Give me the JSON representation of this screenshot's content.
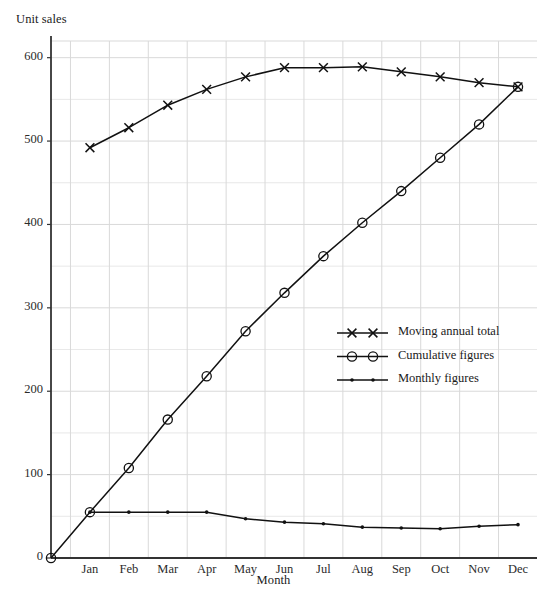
{
  "chart_data": {
    "type": "line",
    "title": "",
    "xlabel": "Month",
    "ylabel": "Unit sales",
    "categories": [
      "Jan",
      "Feb",
      "Mar",
      "Apr",
      "May",
      "Jun",
      "Jul",
      "Aug",
      "Sep",
      "Oct",
      "Nov",
      "Dec"
    ],
    "ylim": [
      0,
      620
    ],
    "yticks": [
      0,
      100,
      200,
      300,
      400,
      500,
      600
    ],
    "ytick_labels": [
      "0",
      "100",
      "200",
      "300",
      "400",
      "500",
      "600"
    ],
    "minor_y_step": 50,
    "grid": true,
    "grid_color": "#d9d9d9",
    "legend_position": "center-right",
    "series": [
      {
        "name": "Moving annual total",
        "marker": "x",
        "color": "#111111",
        "values": [
          492,
          516,
          543,
          562,
          577,
          588,
          588,
          589,
          583,
          577,
          570,
          565
        ]
      },
      {
        "name": "Cumulative figures",
        "marker": "circle",
        "color": "#111111",
        "origin_value": 0,
        "values": [
          55,
          108,
          166,
          218,
          272,
          318,
          362,
          402,
          440,
          480,
          520,
          565
        ]
      },
      {
        "name": "Monthly figures",
        "marker": "dot",
        "color": "#111111",
        "values": [
          55,
          55,
          55,
          55,
          47,
          43,
          41,
          37,
          36,
          35,
          38,
          40
        ]
      }
    ]
  },
  "axes": {
    "y_title": "Unit sales",
    "x_title": "Month"
  },
  "legend": {
    "entries": [
      {
        "label": "Moving annual total"
      },
      {
        "label": "Cumulative figures"
      },
      {
        "label": "Monthly figures"
      }
    ]
  }
}
